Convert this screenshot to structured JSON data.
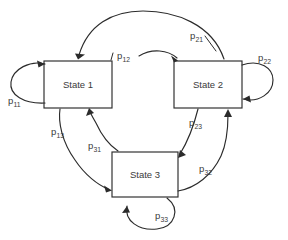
{
  "diagram": {
    "type": "state-transition-diagram",
    "background_color": "#ffffff",
    "line_color": "#2b2b2b",
    "text_color": "#3a3a3a",
    "states": [
      {
        "id": "state1",
        "label": "State 1",
        "x": 44,
        "y": 61,
        "width": 68,
        "height": 47
      },
      {
        "id": "state2",
        "label": "State 2",
        "x": 174,
        "y": 61,
        "width": 68,
        "height": 47
      },
      {
        "id": "state3",
        "label": "State 3",
        "x": 112,
        "y": 152,
        "width": 66,
        "height": 45
      }
    ],
    "transitions": [
      {
        "id": "p11",
        "label": "p",
        "sub": "11",
        "from": "state1",
        "to": "state1",
        "kind": "self-loop",
        "label_x": 8,
        "label_y": 96
      },
      {
        "id": "p12",
        "label": "p",
        "sub": "12",
        "from": "state1",
        "to": "state2",
        "kind": "arc",
        "label_x": 117,
        "label_y": 51
      },
      {
        "id": "p13",
        "label": "p",
        "sub": "13",
        "from": "state1",
        "to": "state3",
        "kind": "arc",
        "label_x": 51,
        "label_y": 127
      },
      {
        "id": "p21",
        "label": "p",
        "sub": "21",
        "from": "state2",
        "to": "state1",
        "kind": "arc",
        "label_x": 190,
        "label_y": 31
      },
      {
        "id": "p22",
        "label": "p",
        "sub": "22",
        "from": "state2",
        "to": "state2",
        "kind": "self-loop",
        "label_x": 258,
        "label_y": 53
      },
      {
        "id": "p23",
        "label": "p",
        "sub": "23",
        "from": "state2",
        "to": "state3",
        "kind": "arc",
        "label_x": 189,
        "label_y": 118
      },
      {
        "id": "p31",
        "label": "p",
        "sub": "31",
        "from": "state3",
        "to": "state1",
        "kind": "arc",
        "label_x": 88,
        "label_y": 141
      },
      {
        "id": "p32",
        "label": "p",
        "sub": "32",
        "from": "state3",
        "to": "state2",
        "kind": "arc",
        "label_x": 199,
        "label_y": 164
      },
      {
        "id": "p33",
        "label": "p",
        "sub": "33",
        "from": "state3",
        "to": "state3",
        "kind": "self-loop",
        "label_x": 155,
        "label_y": 211
      }
    ]
  }
}
